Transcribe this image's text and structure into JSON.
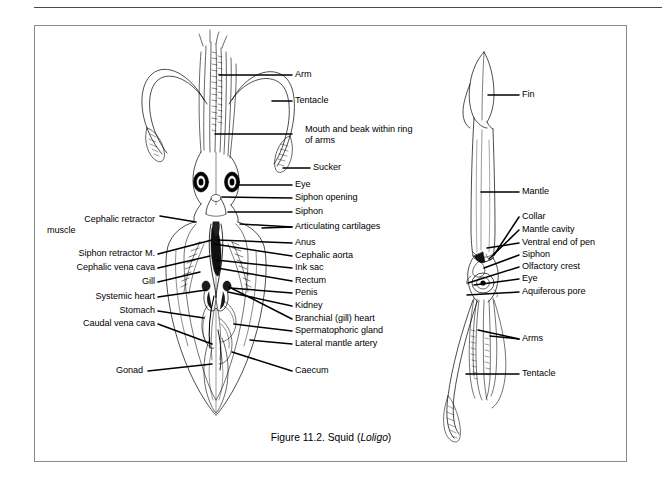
{
  "figure": {
    "caption_prefix": "Figure 11.2. Squid (",
    "caption_italic": "Loligo",
    "caption_suffix": ")",
    "caption_full": "Figure 11.2. Squid (Loligo)"
  },
  "left_figure": {
    "name": "squid-dorsal-dissection",
    "description": "Dorsal view of squid with mantle opened showing internal organs",
    "labels_right_upper": [
      {
        "text": "Arm",
        "x": 295,
        "y": 75
      },
      {
        "text": "Tentacle",
        "x": 295,
        "y": 101
      },
      {
        "text": "Mouth and beak within ring of arms",
        "x": 305,
        "y": 126
      },
      {
        "text": "Sucker",
        "x": 313,
        "y": 166
      }
    ],
    "labels_right_lower": [
      {
        "text": "Eye",
        "x": 295,
        "y": 181
      },
      {
        "text": "Siphon opening",
        "x": 295,
        "y": 194
      },
      {
        "text": "Siphon",
        "x": 295,
        "y": 208
      },
      {
        "text": "Articulating cartilages",
        "x": 295,
        "y": 223
      },
      {
        "text": "Anus",
        "x": 295,
        "y": 239
      },
      {
        "text": "Cephalic aorta",
        "x": 295,
        "y": 252
      },
      {
        "text": "Ink sac",
        "x": 295,
        "y": 264
      },
      {
        "text": "Rectum",
        "x": 295,
        "y": 277
      },
      {
        "text": "Penis",
        "x": 295,
        "y": 289
      },
      {
        "text": "Kidney",
        "x": 295,
        "y": 302
      },
      {
        "text": "Branchial (gill) heart",
        "x": 295,
        "y": 315
      },
      {
        "text": "Spermatophoric gland",
        "x": 295,
        "y": 327
      },
      {
        "text": "Lateral mantle artery",
        "x": 295,
        "y": 340
      },
      {
        "text": "Caecum",
        "x": 295,
        "y": 367
      }
    ],
    "labels_left": [
      {
        "text": "Cephalic retractor",
        "x": 155,
        "y": 216
      },
      {
        "text": "muscle",
        "x": 100,
        "y": 227
      },
      {
        "text": "Siphon retractor M.",
        "x": 155,
        "y": 250
      },
      {
        "text": "Cephalic vena cava",
        "x": 155,
        "y": 264
      },
      {
        "text": "Gill",
        "x": 155,
        "y": 278
      },
      {
        "text": "Systemic heart",
        "x": 155,
        "y": 293
      },
      {
        "text": "Stomach",
        "x": 155,
        "y": 307
      },
      {
        "text": "Caudal vena cava",
        "x": 155,
        "y": 320
      },
      {
        "text": "Gonad",
        "x": 143,
        "y": 367
      }
    ]
  },
  "right_figure": {
    "name": "squid-lateral-view",
    "description": "Lateral external view of squid showing fin, mantle, head and arms",
    "labels": [
      {
        "text": "Fin",
        "x": 522,
        "y": 95
      },
      {
        "text": "Mantle",
        "x": 522,
        "y": 192
      },
      {
        "text": "Collar",
        "x": 522,
        "y": 217
      },
      {
        "text": "Mantle cavity",
        "x": 522,
        "y": 230
      },
      {
        "text": "Ventral end of pen",
        "x": 522,
        "y": 243
      },
      {
        "text": "Siphon",
        "x": 522,
        "y": 255
      },
      {
        "text": "Olfactory crest",
        "x": 522,
        "y": 267
      },
      {
        "text": "Eye",
        "x": 522,
        "y": 279
      },
      {
        "text": "Aquiferous pore",
        "x": 522,
        "y": 292
      },
      {
        "text": "Arms",
        "x": 522,
        "y": 339
      },
      {
        "text": "Tentacle",
        "x": 522,
        "y": 374
      }
    ]
  },
  "colors": {
    "ink": "#000000",
    "background": "#ffffff",
    "box_border": "#8a8a8a",
    "rule": "#4a4a4a"
  }
}
